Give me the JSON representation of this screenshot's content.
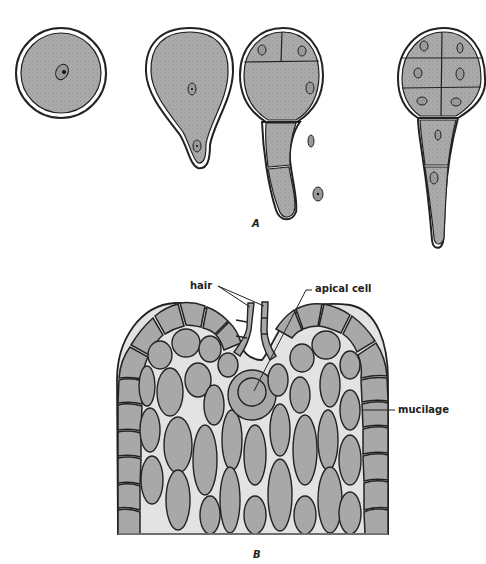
{
  "figure": {
    "panel_a": {
      "label": "A",
      "stages": [
        {
          "name": "single-cell zygote",
          "cells": 1
        },
        {
          "name": "two-celled pear-shaped stage",
          "cells": 2
        },
        {
          "name": "four-celled stage",
          "cells": 4
        },
        {
          "name": "eight-celled stage",
          "cells": 8
        }
      ]
    },
    "panel_b": {
      "label": "B",
      "annotations": {
        "hair": "hair",
        "apical_cell": "apical cell",
        "mucilage": "mucilage"
      }
    }
  },
  "colors": {
    "cell_fill": "#a8a8a8",
    "outline": "#222222",
    "background": "#ffffff"
  }
}
